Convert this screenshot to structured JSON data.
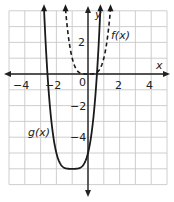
{
  "chart_data": {
    "type": "line",
    "title": "",
    "xlabel": "x",
    "ylabel": "y",
    "xlim": [
      -5,
      5
    ],
    "ylim": [
      -7,
      4
    ],
    "grid": true,
    "x_ticks": [
      -4,
      -2,
      0,
      2,
      4
    ],
    "y_ticks": [
      -4,
      -2,
      2
    ],
    "x_tick_labels": [
      "−4",
      "−2",
      "0",
      "2",
      "4"
    ],
    "y_tick_labels": [
      "−4",
      "−2",
      "2"
    ],
    "series": [
      {
        "name": "f(x)",
        "style": "dashed",
        "expression": "x^4",
        "points": [
          [
            -1.41,
            4
          ],
          [
            -1,
            1
          ],
          [
            -0.5,
            0.06
          ],
          [
            0,
            0
          ],
          [
            0.5,
            0.06
          ],
          [
            1,
            1
          ],
          [
            1.41,
            4
          ]
        ]
      },
      {
        "name": "g(x)",
        "style": "solid",
        "expression": "(x+1)^4 - 6",
        "points": [
          [
            -2.75,
            3.4
          ],
          [
            -2.56,
            0
          ],
          [
            -2,
            -5
          ],
          [
            -1.5,
            -5.94
          ],
          [
            -1,
            -6
          ],
          [
            -0.5,
            -5.94
          ],
          [
            0,
            -5
          ],
          [
            0.56,
            0
          ],
          [
            0.75,
            3.4
          ]
        ]
      }
    ],
    "annotations": [
      {
        "text": "f(x)",
        "near": [
          1.3,
          2.3
        ]
      },
      {
        "text": "g(x)",
        "near": [
          -3.6,
          -3.8
        ]
      }
    ]
  },
  "labels": {
    "x_axis": "x",
    "y_axis": "y",
    "f_label": "f(x)",
    "g_label": "g(x)",
    "tick_x_m4": "−4",
    "tick_x_m2": "−2",
    "tick_origin": "0",
    "tick_x_2": "2",
    "tick_x_4": "4",
    "tick_y_2": "2",
    "tick_y_m2": "−2",
    "tick_y_m4": "−4"
  },
  "colors": {
    "grid": "#c8c8c8",
    "axis": "#222222",
    "curve": "#1a1a1a"
  }
}
